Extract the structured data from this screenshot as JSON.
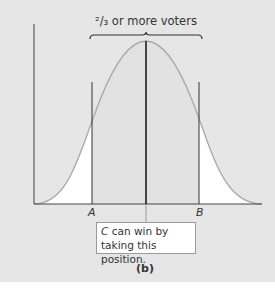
{
  "diagram": {
    "top_label": "²/₃ or more voters",
    "axis_markers": [
      {
        "label": "A",
        "x_position": 92
      },
      {
        "label": "B",
        "x_position": 199
      }
    ],
    "callout": {
      "candidate": "C",
      "text": " can win by taking this position."
    },
    "caption": "(b)",
    "colors": {
      "background": "#e6e6e6",
      "curve": "#a8a8a8",
      "outer_fill": "#ffffff",
      "inner_fill": "#e3e3e3",
      "lines": "#222222"
    }
  }
}
